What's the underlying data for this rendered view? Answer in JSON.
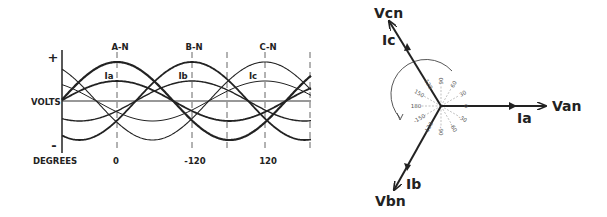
{
  "waveform": {
    "y_axis_label": "VOLTS",
    "x_axis_label": "DEGREES",
    "plus_label": "+",
    "minus_label": "-",
    "phase_labels": [
      "A-N",
      "B-N",
      "C-N"
    ],
    "current_labels": [
      "Ia",
      "Ib",
      "Ic"
    ],
    "degree_ticks": [
      "0",
      "-120",
      "120"
    ]
  },
  "phasor": {
    "voltages": [
      "Van",
      "Vbn",
      "Vcn"
    ],
    "currents": [
      "Ia",
      "Ib",
      "Ic"
    ],
    "angle_labels": [
      "0",
      "30",
      "60",
      "90",
      "120",
      "150",
      "180",
      "-150",
      "-120",
      "-90",
      "-60",
      "-30"
    ]
  },
  "colors": {
    "line": "#222222",
    "dash": "#666666",
    "bg": "#ffffff"
  }
}
